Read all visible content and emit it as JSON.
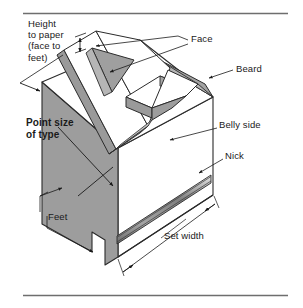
{
  "figure": {
    "title_hidden": "",
    "type": "technical-illustration",
    "letter_on_face": "A",
    "rules": {
      "top_rule": true,
      "bottom_rule": true
    },
    "colors": {
      "ink": "#1a1a1a",
      "line": "#2b2b2b",
      "shade_dark": "#9a9a9a",
      "shade_mid": "#a8a8a8",
      "shade_light": "#c9c9c9",
      "white_face": "#ffffff",
      "paper": "#ffffff",
      "rule": "#6e6e6e"
    },
    "labels": [
      {
        "id": "height-to-paper",
        "text": "Height\nto paper\n(face to\nfeet)",
        "lines": [
          "Height",
          "to paper",
          "(face to",
          "feet)"
        ],
        "bold": false,
        "anchor": "top-left"
      },
      {
        "id": "face",
        "text": "Face",
        "lines": [
          "Face"
        ],
        "bold": false,
        "anchor": "top-right"
      },
      {
        "id": "beard",
        "text": "Beard",
        "lines": [
          "Beard"
        ],
        "bold": false,
        "anchor": "right"
      },
      {
        "id": "belly-side",
        "text": "Belly side",
        "lines": [
          "Belly side"
        ],
        "bold": false,
        "anchor": "right"
      },
      {
        "id": "nick",
        "text": "Nick",
        "lines": [
          "Nick"
        ],
        "bold": false,
        "anchor": "right"
      },
      {
        "id": "point-size-of-type",
        "text": "Point size\nof type",
        "lines": [
          "Point size",
          "of type"
        ],
        "bold": true,
        "anchor": "left"
      },
      {
        "id": "feet",
        "text": "Feet",
        "lines": [
          "Feet"
        ],
        "bold": false,
        "anchor": "bottom-left"
      },
      {
        "id": "set-width",
        "text": "Set width",
        "lines": [
          "Set width"
        ],
        "bold": false,
        "anchor": "bottom-right"
      }
    ],
    "label_text": {
      "height_line1": "Height",
      "height_line2": "to paper",
      "height_line3": "(face to",
      "height_line4": "feet)",
      "face": "Face",
      "beard": "Beard",
      "belly_side": "Belly side",
      "nick": "Nick",
      "point_size_line1": "Point size",
      "point_size_line2": "of type",
      "feet": "Feet",
      "set_width": "Set width"
    }
  }
}
